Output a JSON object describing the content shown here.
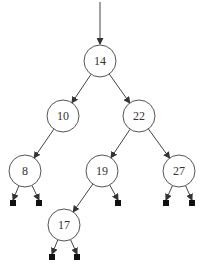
{
  "diagram": {
    "type": "binary-search-tree",
    "entry_arrow": {
      "x": 100,
      "y1": 2,
      "y2": 44
    },
    "node_radius": 16,
    "nodes": [
      {
        "id": "n14",
        "key": "14",
        "x": 100,
        "y": 61
      },
      {
        "id": "n10",
        "key": "10",
        "x": 63,
        "y": 116
      },
      {
        "id": "n22",
        "key": "22",
        "x": 139,
        "y": 116
      },
      {
        "id": "n8",
        "key": "8",
        "x": 25,
        "y": 171
      },
      {
        "id": "n19",
        "key": "19",
        "x": 102,
        "y": 171
      },
      {
        "id": "n27",
        "key": "27",
        "x": 179,
        "y": 171
      },
      {
        "id": "n17",
        "key": "17",
        "x": 64,
        "y": 225
      }
    ],
    "edges": [
      {
        "from": "n14",
        "to": "n10"
      },
      {
        "from": "n14",
        "to": "n22"
      },
      {
        "from": "n10",
        "to": "n8"
      },
      {
        "from": "n22",
        "to": "n19"
      },
      {
        "from": "n22",
        "to": "n27"
      },
      {
        "from": "n19",
        "to": "n17"
      }
    ],
    "nil_leaves": [
      {
        "parent": "n8",
        "x": 13,
        "y": 203
      },
      {
        "parent": "n8",
        "x": 39,
        "y": 203
      },
      {
        "parent": "n19",
        "x": 118,
        "y": 203
      },
      {
        "parent": "n27",
        "x": 166,
        "y": 203
      },
      {
        "parent": "n27",
        "x": 192,
        "y": 203
      },
      {
        "parent": "n17",
        "x": 52,
        "y": 257
      },
      {
        "parent": "n17",
        "x": 77,
        "y": 257
      }
    ],
    "colors": {
      "node_stroke": "#555555",
      "edge": "#444444",
      "leaf": "#111111",
      "label": "#333333"
    }
  }
}
